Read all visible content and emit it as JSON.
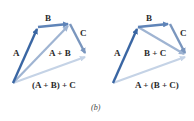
{
  "figure": {
    "caption": "(b)",
    "colors": {
      "A": "#3a66a3",
      "B": "#5f84b8",
      "C": "#7a96be",
      "partial_sum": "#9fb4d2",
      "total_sum": "#c5d3e6",
      "text": "#2b2b2b"
    }
  },
  "left_diagram": {
    "labels": {
      "A": "A",
      "B": "B",
      "C": "C",
      "partial": "A + B",
      "total": "(A + B) + C"
    }
  },
  "right_diagram": {
    "labels": {
      "A": "A",
      "B": "B",
      "C": "C",
      "partial": "B + C",
      "total": "A + (B + C)"
    }
  }
}
